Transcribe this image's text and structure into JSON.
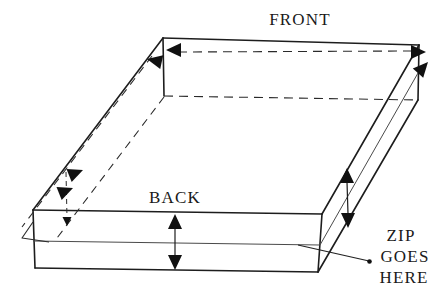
{
  "diagram": {
    "labels": {
      "front": "FRONT",
      "back": "BACK",
      "zip_note_line1": "ZIP",
      "zip_note_line2": "GOES",
      "zip_note_line3": "HERE"
    },
    "colors": {
      "background": "#ffffff",
      "outline": "#1d1d1d",
      "thin_line": "#4a4a4a",
      "arrow_fill": "#111111",
      "text": "#1a1a1a"
    },
    "icons": {
      "arrowhead": "solid-triangle",
      "leader_end": "dot"
    }
  }
}
